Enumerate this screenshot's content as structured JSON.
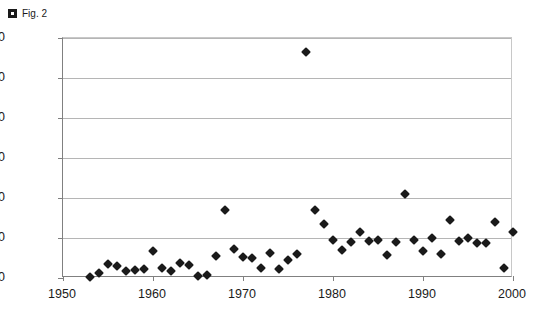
{
  "caption": {
    "marker_icon": "bullet-square-icon",
    "text": "Fig. 2"
  },
  "chart_data": {
    "type": "scatter",
    "title": "",
    "xlabel": "",
    "ylabel": "",
    "xlim": [
      1950,
      2000
    ],
    "ylim": [
      0,
      12000
    ],
    "xticks": [
      "1950",
      "1960",
      "1970",
      "1980",
      "1990",
      "2000"
    ],
    "yticks": [
      "0",
      "2000",
      "4000",
      "6000",
      "8000",
      "10000",
      "12000"
    ],
    "grid": "horizontal",
    "legend": "none",
    "marker_style": "filled-diamond",
    "marker_color": "#1a1a1a",
    "series": [
      {
        "name": "series-1",
        "points": [
          [
            1953,
            50
          ],
          [
            1954,
            250
          ],
          [
            1955,
            700
          ],
          [
            1956,
            600
          ],
          [
            1957,
            350
          ],
          [
            1958,
            400
          ],
          [
            1959,
            450
          ],
          [
            1960,
            1350
          ],
          [
            1961,
            500
          ],
          [
            1962,
            350
          ],
          [
            1963,
            750
          ],
          [
            1964,
            650
          ],
          [
            1965,
            100
          ],
          [
            1966,
            150
          ],
          [
            1967,
            1100
          ],
          [
            1968,
            3400
          ],
          [
            1969,
            1450
          ],
          [
            1970,
            1050
          ],
          [
            1971,
            1000
          ],
          [
            1972,
            500
          ],
          [
            1973,
            1250
          ],
          [
            1974,
            450
          ],
          [
            1975,
            900
          ],
          [
            1976,
            1200
          ],
          [
            1977,
            11300
          ],
          [
            1978,
            3400
          ],
          [
            1979,
            2700
          ],
          [
            1980,
            1900
          ],
          [
            1981,
            1400
          ],
          [
            1982,
            1800
          ],
          [
            1983,
            2300
          ],
          [
            1984,
            1850
          ],
          [
            1985,
            1900
          ],
          [
            1986,
            1150
          ],
          [
            1987,
            1800
          ],
          [
            1988,
            4200
          ],
          [
            1989,
            1900
          ],
          [
            1990,
            1350
          ],
          [
            1991,
            2000
          ],
          [
            1992,
            1200
          ],
          [
            1993,
            2900
          ],
          [
            1994,
            1850
          ],
          [
            1995,
            2000
          ],
          [
            1996,
            1750
          ],
          [
            1997,
            1750
          ],
          [
            1998,
            2800
          ],
          [
            1999,
            500
          ],
          [
            2000,
            2300
          ]
        ]
      }
    ]
  }
}
